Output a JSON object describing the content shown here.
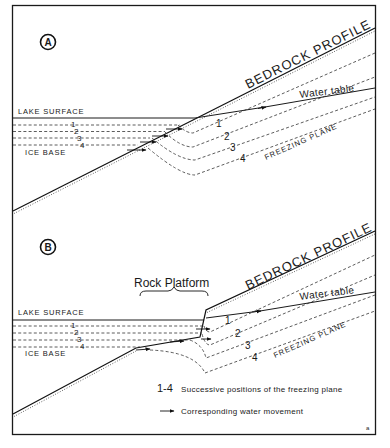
{
  "figure": {
    "panel_a": {
      "marker": "A",
      "labels": {
        "bedrock_profile": "BEDROCK PROFILE",
        "water_table": "Water table",
        "lake_surface": "LAKE SURFACE",
        "ice_base": "ICE BASE",
        "freezing_plane": "FREEZING PLANE"
      },
      "left_numbers": [
        "1",
        "2",
        "3",
        "4"
      ],
      "right_numbers": [
        "1",
        "2",
        "3",
        "4"
      ]
    },
    "panel_b": {
      "marker": "B",
      "labels": {
        "rock_platform": "Rock Platform",
        "bedrock_profile": "BEDROCK PROFILE",
        "water_table": "Water table",
        "lake_surface": "LAKE SURFACE",
        "ice_base": "ICE BASE",
        "freezing_plane": "FREEZING PLANE"
      },
      "left_numbers": [
        "1",
        "2",
        "3",
        "4"
      ],
      "right_numbers": [
        "1",
        "2",
        "3",
        "4"
      ]
    },
    "legend": {
      "range_label": "1-4",
      "range_text": "Successive positions of the freezing plane",
      "arrow_text": "Corresponding water movement"
    },
    "corner_mark": "a",
    "colors": {
      "ink": "#1a1a1a",
      "paper": "#ffffff"
    }
  }
}
